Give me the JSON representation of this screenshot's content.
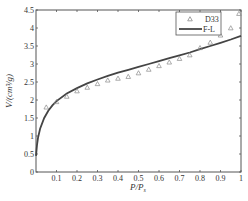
{
  "chart_data": {
    "type": "scatter",
    "title": "",
    "xlabel": "P/Ps",
    "xlabel_main": "P/P",
    "xlabel_sub": "s",
    "ylabel": "V/(cm³/g)",
    "xlim": [
      0,
      1
    ],
    "ylim": [
      0,
      4.5
    ],
    "xticks": [
      0.1,
      0.2,
      0.3,
      0.4,
      0.5,
      0.6,
      0.7,
      0.8,
      0.9,
      1
    ],
    "xtick_labels": [
      "0.1",
      "0.2",
      "0.3",
      "0.4",
      "0.5",
      "0.6",
      "0.7",
      "0.8",
      "0.9",
      "1"
    ],
    "yticks": [
      0,
      0.5,
      1,
      1.5,
      2,
      2.5,
      3,
      3.5,
      4,
      4.5
    ],
    "ytick_labels": [
      "0",
      "0.5",
      "1",
      "1.5",
      "2",
      "2.5",
      "3",
      "3.5",
      "4",
      "4.5"
    ],
    "grid": false,
    "legend_position": "upper right",
    "series": [
      {
        "name": "D33",
        "kind": "scatter",
        "marker": "triangle-open",
        "color": "#8a8a8a",
        "x": [
          0.05,
          0.1,
          0.15,
          0.2,
          0.25,
          0.3,
          0.35,
          0.4,
          0.45,
          0.5,
          0.55,
          0.6,
          0.65,
          0.7,
          0.75,
          0.8,
          0.85,
          0.9,
          0.95,
          0.99
        ],
        "y": [
          1.8,
          1.95,
          2.1,
          2.25,
          2.35,
          2.45,
          2.55,
          2.6,
          2.65,
          2.75,
          2.85,
          2.95,
          3.05,
          3.15,
          3.25,
          3.45,
          3.6,
          3.8,
          4.0,
          4.4
        ]
      },
      {
        "name": "F-L",
        "kind": "line",
        "color": "#444444",
        "x": [
          0,
          0.005,
          0.01,
          0.02,
          0.04,
          0.06,
          0.08,
          0.1,
          0.15,
          0.2,
          0.25,
          0.3,
          0.35,
          0.4,
          0.45,
          0.5,
          0.55,
          0.6,
          0.65,
          0.7,
          0.75,
          0.8,
          0.85,
          0.9,
          0.95,
          1.0
        ],
        "y": [
          0.45,
          0.75,
          0.95,
          1.2,
          1.5,
          1.7,
          1.85,
          1.97,
          2.18,
          2.33,
          2.46,
          2.57,
          2.67,
          2.76,
          2.84,
          2.92,
          3.0,
          3.08,
          3.16,
          3.24,
          3.32,
          3.41,
          3.5,
          3.59,
          3.68,
          3.78
        ]
      }
    ]
  }
}
